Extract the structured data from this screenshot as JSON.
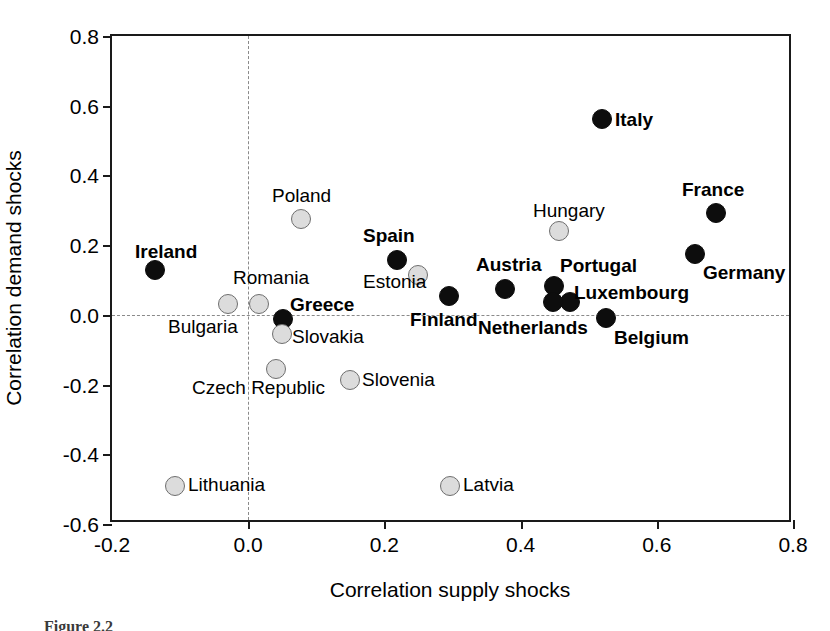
{
  "figure": {
    "caption": "Figure 2.2"
  },
  "chart_data": {
    "type": "scatter",
    "title": "",
    "xlabel": "Correlation supply shocks",
    "ylabel": "Correlation demand shocks",
    "xlim": [
      -0.2,
      0.8
    ],
    "ylim": [
      -0.6,
      0.8
    ],
    "xticks": [
      "-0.2",
      "0.0",
      "0.2",
      "0.4",
      "0.6",
      "0.8"
    ],
    "xtick_values": [
      -0.2,
      0.0,
      0.2,
      0.4,
      0.6,
      0.8
    ],
    "yticks": [
      "0.8",
      "0.6",
      "0.4",
      "0.2",
      "0.0",
      "-0.2",
      "-0.4",
      "-0.6"
    ],
    "ytick_values": [
      0.8,
      0.6,
      0.4,
      0.2,
      0.0,
      -0.2,
      -0.4,
      -0.6
    ],
    "grid": false,
    "zero_lines": {
      "x": 0.0,
      "y": 0.0,
      "style": "dashed"
    },
    "legend": null,
    "series": [
      {
        "name": "euro-area",
        "marker": "filled-circle",
        "color": "#0d0d0d",
        "label_style": "bold",
        "points": [
          {
            "label": "Ireland",
            "x": -0.137,
            "y": 0.13,
            "lx": 135,
            "ly": 242,
            "anchor": "left"
          },
          {
            "label": "Greece",
            "x": 0.051,
            "y": -0.012,
            "lx": 290,
            "ly": 295,
            "anchor": "left"
          },
          {
            "label": "Spain",
            "x": 0.219,
            "y": 0.156,
            "lx": 363,
            "ly": 226,
            "anchor": "left"
          },
          {
            "label": "Finland",
            "x": 0.295,
            "y": 0.055,
            "lx": 410,
            "ly": 310,
            "anchor": "left"
          },
          {
            "label": "Austria",
            "x": 0.377,
            "y": 0.075,
            "lx": 476,
            "ly": 255,
            "anchor": "left"
          },
          {
            "label": "Portugal",
            "x": 0.449,
            "y": 0.083,
            "lx": 560,
            "ly": 256,
            "anchor": "left"
          },
          {
            "label": "Luxembourg",
            "x": 0.472,
            "y": 0.037,
            "lx": 574,
            "ly": 283,
            "anchor": "left"
          },
          {
            "label": "Netherlands",
            "x": 0.448,
            "y": 0.037,
            "lx": 478,
            "ly": 318,
            "anchor": "left"
          },
          {
            "label": "Belgium",
            "x": 0.526,
            "y": -0.01,
            "lx": 614,
            "ly": 328,
            "anchor": "left"
          },
          {
            "label": "Italy",
            "x": 0.52,
            "y": 0.563,
            "lx": 615,
            "ly": 110,
            "anchor": "left"
          },
          {
            "label": "France",
            "x": 0.687,
            "y": 0.292,
            "lx": 682,
            "ly": 180,
            "anchor": "left"
          },
          {
            "label": "Germany",
            "x": 0.656,
            "y": 0.174,
            "lx": 703,
            "ly": 263,
            "anchor": "left"
          }
        ]
      },
      {
        "name": "non-euro-area",
        "marker": "open-circle",
        "color": "#dcdcdc",
        "label_style": "regular",
        "points": [
          {
            "label": "Bulgaria",
            "x": -0.03,
            "y": 0.03,
            "lx": 168,
            "ly": 317,
            "anchor": "left"
          },
          {
            "label": "Romania",
            "x": 0.016,
            "y": 0.03,
            "lx": 233,
            "ly": 268,
            "anchor": "left"
          },
          {
            "label": "Poland",
            "x": 0.078,
            "y": 0.275,
            "lx": 272,
            "ly": 186,
            "anchor": "left"
          },
          {
            "label": "Slovakia",
            "x": 0.05,
            "y": -0.055,
            "lx": 292,
            "ly": 327,
            "anchor": "left"
          },
          {
            "label": "Czech Republic",
            "x": 0.041,
            "y": -0.155,
            "lx": 192,
            "ly": 378,
            "anchor": "left"
          },
          {
            "label": "Slovenia",
            "x": 0.15,
            "y": -0.187,
            "lx": 362,
            "ly": 370,
            "anchor": "left"
          },
          {
            "label": "Estonia",
            "x": 0.249,
            "y": 0.114,
            "lx": 363,
            "ly": 272,
            "anchor": "left"
          },
          {
            "label": "Hungary",
            "x": 0.457,
            "y": 0.241,
            "lx": 533,
            "ly": 201,
            "anchor": "left"
          },
          {
            "label": "Lithuania",
            "x": -0.107,
            "y": -0.49,
            "lx": 188,
            "ly": 475,
            "anchor": "left"
          },
          {
            "label": "Latvia",
            "x": 0.296,
            "y": -0.49,
            "lx": 463,
            "ly": 475,
            "anchor": "left"
          }
        ]
      }
    ]
  }
}
